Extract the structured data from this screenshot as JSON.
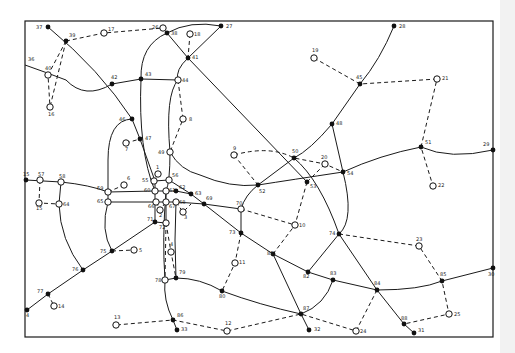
{
  "diagram": {
    "title": "",
    "colors": {
      "ink": "#111111",
      "background": "#ffffff"
    },
    "frame": {
      "x": 25,
      "y": 21,
      "w": 468,
      "h": 316
    },
    "nodes": [
      {
        "id": "37",
        "x": 48,
        "y": 27,
        "type": "filled",
        "lx": -12,
        "ly": 2
      },
      {
        "id": "39",
        "x": 66,
        "y": 41,
        "type": "filled",
        "lx": 0,
        "ly": -4
      },
      {
        "id": "17",
        "x": 104,
        "y": 33,
        "type": "open",
        "lx": 4,
        "ly": -2
      },
      {
        "id": "26",
        "x": 163,
        "y": 28,
        "type": "open",
        "lx": -11,
        "ly": 1
      },
      {
        "id": "38",
        "x": 167,
        "y": 33,
        "type": "filled",
        "lx": 4,
        "ly": 2
      },
      {
        "id": "27",
        "x": 221,
        "y": 26,
        "type": "filled",
        "lx": 5,
        "ly": 2
      },
      {
        "id": "18",
        "x": 190,
        "y": 34,
        "type": "open",
        "lx": 4,
        "ly": 2
      },
      {
        "id": "41",
        "x": 188,
        "y": 58,
        "type": "filled",
        "lx": 4,
        "ly": 1
      },
      {
        "id": "36",
        "x": 25,
        "y": 65,
        "type": "none",
        "lx": 0,
        "ly": -4
      },
      {
        "id": "40",
        "x": 48,
        "y": 75,
        "type": "open",
        "lx": -3,
        "ly": -5
      },
      {
        "id": "16",
        "x": 50,
        "y": 107,
        "type": "open",
        "lx": -2,
        "ly": 9
      },
      {
        "id": "42",
        "x": 112,
        "y": 84,
        "type": "filled",
        "lx": -1,
        "ly": -5
      },
      {
        "id": "43",
        "x": 141,
        "y": 79,
        "type": "filled",
        "lx": 4,
        "ly": -3
      },
      {
        "id": "44",
        "x": 178,
        "y": 80,
        "type": "open",
        "lx": 4,
        "ly": 2
      },
      {
        "id": "28",
        "x": 394,
        "y": 26,
        "type": "filled",
        "lx": 5,
        "ly": 2
      },
      {
        "id": "19",
        "x": 314,
        "y": 58,
        "type": "open",
        "lx": -2,
        "ly": -6
      },
      {
        "id": "45",
        "x": 360,
        "y": 84,
        "type": "filled",
        "lx": -4,
        "ly": -5
      },
      {
        "id": "21",
        "x": 437,
        "y": 79,
        "type": "open",
        "lx": 5,
        "ly": 1
      },
      {
        "id": "46",
        "x": 132,
        "y": 119,
        "type": "filled",
        "lx": -13,
        "ly": 0
      },
      {
        "id": "47",
        "x": 140,
        "y": 139,
        "type": "filled",
        "lx": 5,
        "ly": 1
      },
      {
        "id": "7",
        "x": 126,
        "y": 143,
        "type": "open",
        "lx": -1,
        "ly": 8
      },
      {
        "id": "8",
        "x": 183,
        "y": 119,
        "type": "open",
        "lx": 6,
        "ly": 2
      },
      {
        "id": "48",
        "x": 332,
        "y": 124,
        "type": "filled",
        "lx": 4,
        "ly": 1
      },
      {
        "id": "49",
        "x": 170,
        "y": 152,
        "type": "open",
        "lx": -12,
        "ly": 2
      },
      {
        "id": "51",
        "x": 421,
        "y": 147,
        "type": "filled",
        "lx": 4,
        "ly": -3
      },
      {
        "id": "29",
        "x": 493,
        "y": 150,
        "type": "filled",
        "lx": -10,
        "ly": -4
      },
      {
        "id": "9",
        "x": 234,
        "y": 155,
        "type": "open",
        "lx": -1,
        "ly": -5
      },
      {
        "id": "50",
        "x": 294,
        "y": 158,
        "type": "filled",
        "lx": -2,
        "ly": -5
      },
      {
        "id": "20",
        "x": 325,
        "y": 164,
        "type": "open",
        "lx": -4,
        "ly": -5
      },
      {
        "id": "54",
        "x": 343,
        "y": 172,
        "type": "filled",
        "lx": 4,
        "ly": 3
      },
      {
        "id": "52",
        "x": 258,
        "y": 185,
        "type": "filled",
        "lx": 1,
        "ly": 8
      },
      {
        "id": "53",
        "x": 307,
        "y": 182,
        "type": "filled",
        "lx": 3,
        "ly": 6
      },
      {
        "id": "22",
        "x": 433,
        "y": 186,
        "type": "open",
        "lx": 5,
        "ly": 1
      },
      {
        "id": "15a",
        "label": "15",
        "x": 26,
        "y": 180,
        "type": "filled",
        "lx": -3,
        "ly": -4
      },
      {
        "id": "57",
        "x": 40,
        "y": 180,
        "type": "open",
        "lx": -2,
        "ly": -4
      },
      {
        "id": "58",
        "x": 61,
        "y": 182,
        "type": "open",
        "lx": -2,
        "ly": -4
      },
      {
        "id": "13b",
        "label": "15",
        "x": 39,
        "y": 203,
        "type": "open",
        "lx": -3,
        "ly": 7
      },
      {
        "id": "64",
        "x": 59,
        "y": 204,
        "type": "open",
        "lx": 4,
        "ly": 2
      },
      {
        "id": "6",
        "x": 124,
        "y": 185,
        "type": "open",
        "lx": 0,
        "ly": -5
      },
      {
        "id": "59",
        "x": 108,
        "y": 192,
        "type": "open",
        "lx": -11,
        "ly": -2
      },
      {
        "id": "55",
        "x": 154,
        "y": 181,
        "type": "open",
        "lx": -12,
        "ly": 1
      },
      {
        "id": "1",
        "x": 158,
        "y": 174,
        "type": "open",
        "lx": -2,
        "ly": -5
      },
      {
        "id": "56",
        "x": 169,
        "y": 180,
        "type": "open",
        "lx": 3,
        "ly": -3
      },
      {
        "id": "60",
        "x": 155,
        "y": 191,
        "type": "open",
        "lx": -11,
        "ly": 1
      },
      {
        "id": "61",
        "x": 166,
        "y": 191,
        "type": "open",
        "lx": 3,
        "ly": 1
      },
      {
        "id": "62",
        "x": 176,
        "y": 191,
        "type": "filled",
        "lx": 3,
        "ly": -2
      },
      {
        "id": "63",
        "x": 191,
        "y": 194,
        "type": "filled",
        "lx": 4,
        "ly": 1
      },
      {
        "id": "65",
        "x": 108,
        "y": 202,
        "type": "open",
        "lx": -11,
        "ly": 1
      },
      {
        "id": "66",
        "x": 156,
        "y": 202,
        "type": "open",
        "lx": -8,
        "ly": 6
      },
      {
        "id": "67",
        "x": 166,
        "y": 202,
        "type": "open",
        "lx": 3,
        "ly": 6
      },
      {
        "id": "68",
        "x": 176,
        "y": 202,
        "type": "open",
        "lx": 3,
        "ly": 0
      },
      {
        "id": "2",
        "x": 160,
        "y": 210,
        "type": "open",
        "lx": -1,
        "ly": 7
      },
      {
        "id": "3",
        "x": 183,
        "y": 212,
        "type": "open",
        "lx": 1,
        "ly": 7
      },
      {
        "id": "69",
        "x": 204,
        "y": 204,
        "type": "filled",
        "lx": 2,
        "ly": -4
      },
      {
        "id": "70",
        "x": 241,
        "y": 209,
        "type": "open",
        "lx": -5,
        "ly": -4
      },
      {
        "id": "71",
        "x": 155,
        "y": 222,
        "type": "filled",
        "lx": -8,
        "ly": -1
      },
      {
        "id": "72",
        "x": 166,
        "y": 223,
        "type": "open",
        "lx": -7,
        "ly": 6
      },
      {
        "id": "10",
        "x": 295,
        "y": 225,
        "type": "open",
        "lx": 4,
        "ly": 2
      },
      {
        "id": "73",
        "x": 241,
        "y": 233,
        "type": "filled",
        "lx": -12,
        "ly": 1
      },
      {
        "id": "74",
        "x": 339,
        "y": 234,
        "type": "filled",
        "lx": -10,
        "ly": 1
      },
      {
        "id": "23",
        "x": 419,
        "y": 246,
        "type": "open",
        "lx": -3,
        "ly": -5
      },
      {
        "id": "5",
        "x": 134,
        "y": 250,
        "type": "open",
        "lx": 5,
        "ly": 2
      },
      {
        "id": "75",
        "x": 112,
        "y": 251,
        "type": "filled",
        "lx": -12,
        "ly": 0
      },
      {
        "id": "4",
        "x": 171,
        "y": 252,
        "type": "open",
        "lx": -1,
        "ly": -6
      },
      {
        "id": "11",
        "x": 235,
        "y": 263,
        "type": "open",
        "lx": 4,
        "ly": 1
      },
      {
        "id": "81",
        "x": 273,
        "y": 254,
        "type": "filled",
        "lx": -6,
        "ly": 1
      },
      {
        "id": "76",
        "x": 83,
        "y": 270,
        "type": "filled",
        "lx": -11,
        "ly": 1
      },
      {
        "id": "82",
        "x": 308,
        "y": 272,
        "type": "filled",
        "lx": -5,
        "ly": 6
      },
      {
        "id": "83",
        "x": 333,
        "y": 280,
        "type": "filled",
        "lx": -3,
        "ly": -5
      },
      {
        "id": "85",
        "x": 442,
        "y": 281,
        "type": "filled",
        "lx": -2,
        "ly": -5
      },
      {
        "id": "30",
        "x": 493,
        "y": 268,
        "type": "filled",
        "lx": -5,
        "ly": 8
      },
      {
        "id": "78",
        "x": 165,
        "y": 280,
        "type": "open",
        "lx": -10,
        "ly": 2
      },
      {
        "id": "79",
        "x": 176,
        "y": 278,
        "type": "filled",
        "lx": 3,
        "ly": -4
      },
      {
        "id": "84",
        "x": 377,
        "y": 290,
        "type": "filled",
        "lx": -3,
        "ly": -5
      },
      {
        "id": "77",
        "x": 48,
        "y": 294,
        "type": "filled",
        "lx": -11,
        "ly": -1
      },
      {
        "id": "14",
        "x": 54,
        "y": 306,
        "type": "open",
        "lx": 4,
        "ly": 2
      },
      {
        "id": "80",
        "x": 222,
        "y": 291,
        "type": "filled",
        "lx": -3,
        "ly": 7
      },
      {
        "id": "9b",
        "label": "4",
        "x": 27,
        "y": 310,
        "type": "filled",
        "lx": -1,
        "ly": 7
      },
      {
        "id": "87",
        "x": 301,
        "y": 314,
        "type": "filled",
        "lx": 2,
        "ly": -4
      },
      {
        "id": "25",
        "x": 449,
        "y": 314,
        "type": "open",
        "lx": 5,
        "ly": 2
      },
      {
        "id": "13",
        "x": 116,
        "y": 325,
        "type": "open",
        "lx": -2,
        "ly": -6
      },
      {
        "id": "86",
        "x": 173,
        "y": 320,
        "type": "filled",
        "lx": 4,
        "ly": -3
      },
      {
        "id": "12",
        "x": 227,
        "y": 331,
        "type": "open",
        "lx": -2,
        "ly": -6
      },
      {
        "id": "88",
        "x": 404,
        "y": 324,
        "type": "filled",
        "lx": -3,
        "ly": -4
      },
      {
        "id": "33",
        "x": 177,
        "y": 330,
        "type": "filled",
        "lx": 4,
        "ly": 1
      },
      {
        "id": "32",
        "x": 309,
        "y": 330,
        "type": "filled",
        "lx": 5,
        "ly": 1
      },
      {
        "id": "24",
        "x": 356,
        "y": 331,
        "type": "open",
        "lx": 4,
        "ly": 2
      },
      {
        "id": "31",
        "x": 414,
        "y": 333,
        "type": "filled",
        "lx": 4,
        "ly": -1
      }
    ],
    "solid_paths": [
      "M48,27 Q100,70 132,119 L140,139 L155,181",
      "M25,65 Q45,72 66,80 Q85,100 112,84 L141,79 L178,80",
      "M141,79 Q138,150 155,191",
      "M178,80 Q165,95 170,152 Q170,182 166,191",
      "M167,33 L188,58 L221,26 Q190,20 167,33 Q140,45 141,79",
      "M188,58 Q175,70 178,80",
      "M188,58 L307,182",
      "M394,26 Q380,60 360,84 L332,124 Q310,150 294,158 L258,185 Q245,195 241,209",
      "M170,152 Q180,170 200,175 Q230,188 258,185 Q290,180 343,172 Q380,155 421,147 Q450,160 493,150",
      "M332,124 L343,172 Q355,220 339,234",
      "M294,158 Q320,180 339,234 L377,290 L404,324 L414,333",
      "M26,180 L61,182 Q90,185 108,192 L155,191 L176,191 L191,194 L204,204",
      "M108,202 L176,202 L204,204 L241,209",
      "M132,119 Q108,120 108,160 L108,202 Q100,230 112,251",
      "M61,182 L59,204 Q60,240 83,270",
      "M204,204 L241,233 L273,254 L308,272 L333,280 L377,290 Q420,290 442,281 L493,268",
      "M241,209 L241,233",
      "M27,310 L48,294 L83,270 L112,251 L155,222 L166,223",
      "M155,181 L155,222",
      "M166,191 L166,223",
      "M166,191 Q162,240 165,280 Q163,300 173,320 L177,330",
      "M176,202 Q174,240 176,278",
      "M165,280 L176,278 Q200,278 222,291 Q260,305 301,314 Q325,305 333,280",
      "M273,254 L301,314 L309,330",
      "M308,272 L339,234",
      "M154,181 L169,180 L191,194"
    ],
    "dashed_paths": [
      "M66,41 L104,33 L163,28",
      "M66,41 L48,75 L50,107",
      "M66,41 L50,107",
      "M190,34 L188,58",
      "M178,80 L183,119 L170,152",
      "M314,58 L360,84 L437,79 L421,147 L433,186",
      "M126,143 L140,139",
      "M234,155 Q270,145 294,158 L325,164 L343,172",
      "M234,155 L258,185",
      "M307,182 L325,164",
      "M307,182 L295,225 L273,254",
      "M241,209 L295,225",
      "M241,233 L235,263 L222,291",
      "M339,234 L419,246 L442,281 L449,314 L404,324",
      "M377,290 L356,331 L301,314 L227,331 L173,320 L116,325",
      "M40,180 L39,203 L59,204",
      "M108,192 L124,185",
      "M112,251 L134,250",
      "M48,294 L54,306",
      "M158,174 L154,181",
      "M156,202 L160,210 L166,202",
      "M176,202 L183,212 L191,204",
      "M166,223 L171,252 L176,278",
      "M166,223 L165,280"
    ]
  }
}
